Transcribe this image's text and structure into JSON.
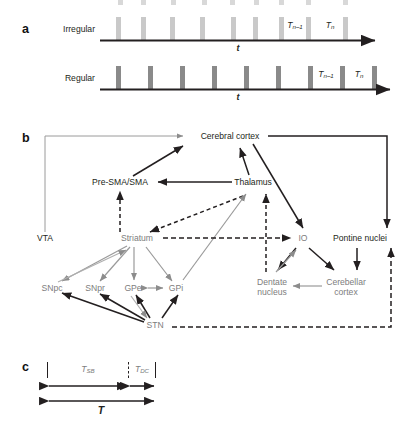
{
  "figure": {
    "panels": [
      {
        "letter": "a"
      },
      {
        "letter": "b"
      },
      {
        "letter": "c"
      }
    ]
  },
  "panel_a": {
    "letter": "a",
    "rows": [
      {
        "name": "irregular",
        "label": "Irregular",
        "bar_color": "#c9c9c9",
        "axis_label": "t",
        "interval_labels": [
          "T",
          "T"
        ],
        "interval_subscripts": [
          "n–1",
          "n"
        ],
        "bar_positions_px": [
          118,
          143,
          172,
          202,
          233,
          255,
          281,
          308,
          345
        ],
        "bar_width_px": 5,
        "bar_height_px": 22
      },
      {
        "name": "regular",
        "label": "Regular",
        "bar_color": "#8a8a8a",
        "axis_label": "t",
        "interval_labels": [
          "T",
          "T"
        ],
        "interval_subscripts": [
          "n–1",
          "n"
        ],
        "bar_positions_px": [
          118,
          150,
          182,
          214,
          246,
          278,
          310,
          342,
          374
        ],
        "bar_width_px": 5,
        "bar_height_px": 22
      }
    ],
    "top_clipped_row": {
      "name": "clipped-row-above",
      "bar_color": "#d6d6d6",
      "bar_positions_px": [
        120,
        143,
        173,
        204,
        232,
        256,
        281,
        308,
        345
      ]
    }
  },
  "panel_b": {
    "letter": "b",
    "nodes": [
      {
        "id": "cerebral-cortex",
        "label": "Cerebral cortex",
        "x": 230,
        "y": 136,
        "color": "#231f20",
        "align": "center"
      },
      {
        "id": "pre-sma-sma",
        "label": "Pre-SMA/SMA",
        "x": 120,
        "y": 182,
        "color": "#231f20",
        "align": "center"
      },
      {
        "id": "thalamus",
        "label": "Thalamus",
        "x": 253,
        "y": 182,
        "color": "#231f20",
        "align": "center"
      },
      {
        "id": "vta",
        "label": "VTA",
        "x": 45,
        "y": 238,
        "color": "#231f20",
        "align": "center"
      },
      {
        "id": "striatum",
        "label": "Striatum",
        "x": 137,
        "y": 238,
        "color": "#7d7d7d",
        "align": "center"
      },
      {
        "id": "io",
        "label": "IO",
        "x": 303,
        "y": 238,
        "color": "#7d7d7d",
        "align": "center"
      },
      {
        "id": "pontine-nuclei",
        "label": "Pontine nuclei",
        "x": 360,
        "y": 238,
        "color": "#231f20",
        "align": "center"
      },
      {
        "id": "snpc",
        "label": "SNpc",
        "x": 52,
        "y": 288,
        "color": "#7d7d7d",
        "align": "center"
      },
      {
        "id": "snpr",
        "label": "SNpr",
        "x": 95,
        "y": 288,
        "color": "#7d7d7d",
        "align": "center"
      },
      {
        "id": "gpe",
        "label": "GPe",
        "x": 133,
        "y": 288,
        "color": "#7d7d7d",
        "align": "center"
      },
      {
        "id": "gpi",
        "label": "GPi",
        "x": 176,
        "y": 288,
        "color": "#7d7d7d",
        "align": "center"
      },
      {
        "id": "stn",
        "label": "STN",
        "x": 155,
        "y": 325,
        "color": "#7d7d7d",
        "align": "center"
      },
      {
        "id": "dentate-nucleus",
        "label": "Dentate\nnucleus",
        "x": 272,
        "y": 283,
        "color": "#7d7d7d",
        "align": "center"
      },
      {
        "id": "cerebellar-cortex",
        "label": "Cerebellar\ncortex",
        "x": 346,
        "y": 283,
        "color": "#7d7d7d",
        "align": "center"
      }
    ],
    "node_labels": {
      "cerebral_cortex": "Cerebral cortex",
      "pre_sma_sma": "Pre-SMA/SMA",
      "thalamus": "Thalamus",
      "vta": "VTA",
      "striatum": "Striatum",
      "io": "IO",
      "pontine_nuclei": "Pontine nuclei",
      "snpc": "SNpc",
      "snpr": "SNpr",
      "gpe": "GPe",
      "gpi": "GPi",
      "stn": "STN",
      "dentate_nucleus_line1": "Dentate",
      "dentate_nucleus_line2": "nucleus",
      "cerebellar_cortex_line1": "Cerebellar",
      "cerebellar_cortex_line2": "cortex"
    },
    "edge_styles": {
      "solid_black": "#231f20",
      "solid_gray": "#8c8c8c",
      "dashed_black": "#231f20"
    }
  },
  "panel_c": {
    "letter": "c",
    "segments": [
      {
        "id": "t-sb",
        "label": "T",
        "subscript": "SB",
        "color": "#7d7d7d"
      },
      {
        "id": "t-dc",
        "label": "T",
        "subscript": "DC",
        "color": "#7d7d7d"
      }
    ],
    "total": {
      "id": "t-total",
      "label": "T",
      "color": "#231f20"
    },
    "ticks_px": [
      55,
      130,
      155
    ],
    "baseline_y_px": 388,
    "total_y_px": 402
  }
}
